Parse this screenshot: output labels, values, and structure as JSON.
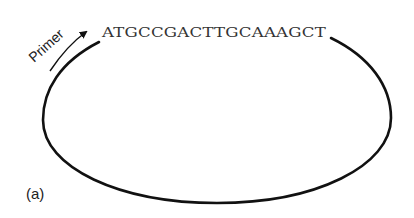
{
  "figure": {
    "panel_label": "(a)",
    "sequence": "ATGCCGACTTGCAAAGCT",
    "primer_label": "Primer",
    "colors": {
      "stroke": "#111111",
      "text": "#333333",
      "background": "#ffffff"
    }
  }
}
